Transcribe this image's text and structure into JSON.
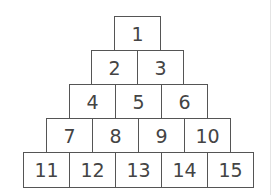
{
  "pyramid": {
    "rows": [
      [
        "1"
      ],
      [
        "2",
        "3"
      ],
      [
        "4",
        "5",
        "6"
      ],
      [
        "7",
        "8",
        "9",
        "10"
      ],
      [
        "11",
        "12",
        "13",
        "14",
        "15"
      ]
    ]
  }
}
